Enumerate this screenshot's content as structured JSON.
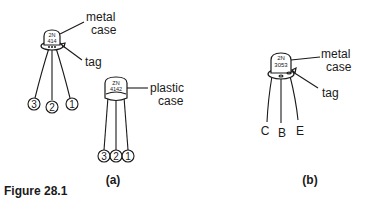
{
  "figure": {
    "caption": "Figure 28.1",
    "panel_a": {
      "label": "(a)",
      "metal_transistor": {
        "marking_line1": "2N",
        "marking_line2": "414",
        "case_label_line1": "metal",
        "case_label_line2": "case",
        "tag_label": "tag",
        "pins": [
          "3",
          "2",
          "1"
        ]
      },
      "plastic_transistor": {
        "marking_line1": "ZN",
        "marking_line2": "4142",
        "case_label_line1": "plastic",
        "case_label_line2": "case",
        "pins": [
          "3",
          "2",
          "1"
        ]
      }
    },
    "panel_b": {
      "label": "(b)",
      "transistor": {
        "marking_line1": "2N",
        "marking_line2": "3053",
        "case_label_line1": "metal",
        "case_label_line2": "case",
        "tag_label": "tag",
        "pins": [
          "C",
          "B",
          "E"
        ]
      }
    }
  }
}
